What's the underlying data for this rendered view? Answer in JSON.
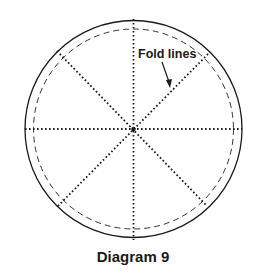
{
  "diagram": {
    "caption": "Diagram 9",
    "annotation": "Fold lines",
    "colors": {
      "stroke": "#1a1a1a",
      "background": "#ffffff"
    },
    "circle": {
      "cx": 133.5,
      "cy": 129,
      "outer_r": 109,
      "inner_dashed_r": 101
    },
    "fold_lines_count": 4
  }
}
